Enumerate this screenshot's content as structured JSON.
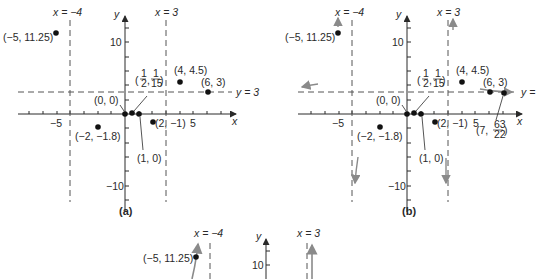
{
  "figure": {
    "panels": [
      {
        "id": "a",
        "caption": "(a)",
        "origin_px": [
          125,
          114
        ],
        "scale_x": 13.7,
        "scale_y": 7.2,
        "x_axis_px": [
          18,
          238
        ],
        "y_axis_px": [
          14,
          212
        ],
        "asymptote_labels": {
          "left": "x = −4",
          "right": "x = 3",
          "horizontal": "y = 3"
        },
        "points": [
          {
            "x": -5,
            "y": 11.25,
            "label": "(−5, 11.25)"
          },
          {
            "x": 0,
            "y": 0,
            "label": "(0, 0)"
          },
          {
            "x": 0.5,
            "y": 0.0667,
            "label": "(1/2, 1/15)"
          },
          {
            "x": 1,
            "y": 0,
            "label": "(1, 0)"
          },
          {
            "x": 2,
            "y": -1,
            "label": "(2, −1)"
          },
          {
            "x": -2,
            "y": -1.8,
            "label": "(−2, −1.8)"
          },
          {
            "x": 4,
            "y": 4.5,
            "label": "(4, 4.5)"
          },
          {
            "x": 6,
            "y": 3,
            "label": "(6, 3)"
          }
        ],
        "tick_labels": {
          "x_neg": "−5",
          "x_pos": "5",
          "y_pos": "10",
          "y_neg": "−10",
          "x_axis": "x",
          "y_axis": "y"
        }
      },
      {
        "id": "b",
        "caption": "(b)",
        "origin_px": [
          410,
          114
        ],
        "scale_x": 13.7,
        "scale_y": 7.2,
        "x_axis_px": [
          298,
          523
        ],
        "y_axis_px": [
          14,
          212
        ],
        "asymptote_labels": {
          "left": "x = −4",
          "right": "x = 3",
          "horizontal": "y ="
        },
        "points": [
          {
            "x": -5,
            "y": 11.25,
            "label": "(−5, 11.25)"
          },
          {
            "x": 0,
            "y": 0,
            "label": "(0, 0)"
          },
          {
            "x": 0.5,
            "y": 0.0667,
            "label": "(1/2, 1/15)"
          },
          {
            "x": 1,
            "y": 0,
            "label": "(1, 0)"
          },
          {
            "x": 2,
            "y": -1,
            "label": "(2, −1)"
          },
          {
            "x": -2,
            "y": -1.8,
            "label": "(−2, −1.8)"
          },
          {
            "x": 4,
            "y": 4.5,
            "label": "(4, 4.5)"
          },
          {
            "x": 6,
            "y": 3,
            "label": "(6, 3)"
          },
          {
            "x": 7,
            "y": 2.8636,
            "label": "(7, 63/22)"
          }
        ],
        "tick_labels": {
          "x_neg": "−5",
          "x_pos": "5",
          "y_pos": "10",
          "y_neg": "−10",
          "x_axis": "x",
          "y_axis": "y"
        }
      },
      {
        "id": "c",
        "caption": "",
        "partial": true,
        "asymptote_labels": {
          "left": "x = −4",
          "right": "x = 3"
        },
        "points": [
          {
            "x": -5,
            "y": 11.25,
            "label": "(−5, 11.25)"
          }
        ],
        "tick_labels": {
          "y_pos": "10",
          "y_axis": "y"
        }
      }
    ]
  },
  "text": {
    "a": {
      "xm4": "x = −4",
      "x3": "x = 3",
      "y3": "y = 3",
      "p_m5": "(−5, 11.25)",
      "p_00": "(0, 0)",
      "p_10": "(1, 0)",
      "p_2m1": "(2, −1)",
      "p_m2": "(−2, −1.8)",
      "p_44": "(4, 4.5)",
      "p_63": "(6, 3)",
      "half_num": "1",
      "half_den": "2",
      "fif_num": "1",
      "fif_den": "15",
      "t_m5": "−5",
      "t_5": "5",
      "t_10": "10",
      "t_m10": "−10",
      "ax_x": "x",
      "ax_y": "y",
      "caption": "(a)"
    },
    "b": {
      "xm4": "x = −4",
      "x3": "x = 3",
      "y3": "y =",
      "p_m5": "(−5, 11.25)",
      "p_00": "(0, 0)",
      "p_10": "(1, 0)",
      "p_2m1": "(2, −1)",
      "p_m2": "(−2, −1.8)",
      "p_44": "(4, 4.5)",
      "p_63": "(6, 3)",
      "p_7_a": "(7,",
      "p_7_num": "63",
      "p_7_den": "22",
      "p_7_b": ")",
      "half_num": "1",
      "half_den": "2",
      "fif_num": "1",
      "fif_den": "15",
      "t_m5": "−5",
      "t_5": "5",
      "t_10": "10",
      "t_m10": "−10",
      "ax_x": "x",
      "ax_y": "y",
      "caption": "(b)"
    },
    "c": {
      "xm4": "x = −4",
      "x3": "x = 3",
      "p_m5": "(−5, 11.25)",
      "t_10": "10",
      "ax_y": "y"
    }
  },
  "colors": {
    "ink": "#2a2a2a",
    "dash": "#555555",
    "arrow_gray": "#8a8a8a"
  }
}
